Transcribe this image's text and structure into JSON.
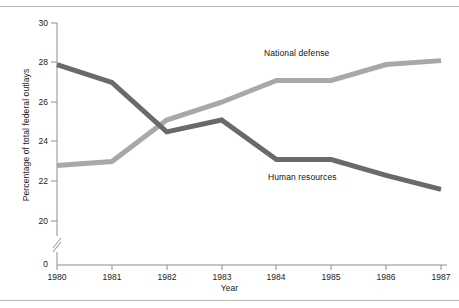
{
  "chart_data": {
    "type": "line",
    "title": "",
    "subtitle": "",
    "xlabel": "Year",
    "ylabel": "Percentage of total federal outlays",
    "x": [
      1980,
      1981,
      1982,
      1983,
      1984,
      1985,
      1986,
      1987
    ],
    "categories": [
      "1980",
      "1981",
      "1982",
      "1983",
      "1984",
      "1985",
      "1986",
      "1987"
    ],
    "series": [
      {
        "name": "National defense",
        "color": "#a8a8a8",
        "values": [
          22.8,
          23.0,
          25.1,
          26.0,
          27.1,
          27.1,
          27.9,
          28.1
        ]
      },
      {
        "name": "Human resources",
        "color": "#6a6a6a",
        "values": [
          27.9,
          27.0,
          24.5,
          25.1,
          23.1,
          23.1,
          22.3,
          21.6
        ]
      }
    ],
    "ylim": [
      20,
      30
    ],
    "yticks": [
      20,
      22,
      24,
      26,
      28,
      30
    ],
    "ytick_labels": [
      "20",
      "22",
      "24",
      "26",
      "28",
      "30"
    ],
    "zero_tick_label": "0",
    "axis_break": true,
    "xlim": [
      1980,
      1987
    ],
    "grid": false,
    "legend": "inline-annotations",
    "annotations": [
      {
        "text": "National defense",
        "x": 1984,
        "y": 28.6
      },
      {
        "text": "Human resources",
        "x": 1984.1,
        "y": 22.2
      }
    ]
  },
  "axis": {
    "y_title": "Percentage of total federal outlays",
    "x_title": "Year"
  }
}
